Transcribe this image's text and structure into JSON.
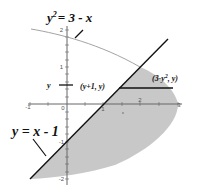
{
  "diagram": {
    "curves": {
      "parabola_label_lhs": "y",
      "parabola_label_exp": "2",
      "parabola_label_rhs": "= 3 - x",
      "line_label": "y = x - 1"
    },
    "points": {
      "left_point": "(y+1, y)",
      "right_point_prefix": "(3-y",
      "right_point_exp": "2",
      "right_point_suffix": ", y)"
    },
    "y_marker": "y",
    "axes": {
      "x_ticks": [
        "-1",
        "0",
        "1",
        "2",
        "3"
      ],
      "y_ticks": [
        "2",
        "1",
        "-1",
        "-2"
      ]
    },
    "colors": {
      "region_fill": "#c8c8c8",
      "line": "#111111",
      "curve": "#999999",
      "axis": "#555555"
    }
  }
}
